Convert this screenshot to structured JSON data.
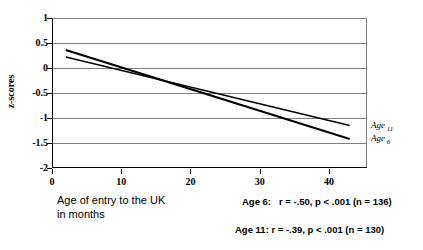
{
  "chart_data": {
    "type": "line",
    "title": "",
    "xlabel": "Age of entry to the UK in months",
    "ylabel": "z-scores",
    "xlim": [
      0,
      45.5
    ],
    "ylim": [
      -2,
      1
    ],
    "grid": true,
    "legend_position": "right-edge-inline",
    "xticks": [
      0,
      10,
      20,
      30,
      40
    ],
    "yticks": [
      1,
      0.5,
      0,
      -0.5,
      -1,
      -1.5,
      -2
    ],
    "series": [
      {
        "name": "Age 6",
        "label": "Age",
        "label_subscript": "6",
        "x": [
          2,
          43
        ],
        "y": [
          0.36,
          -1.42
        ],
        "correlation": "-.50",
        "p_value": "< .001",
        "n": 136,
        "annotation": "Age 6:   r = -.50, p < .001 (n = 136)",
        "color": "#000000",
        "line_width": 2.2
      },
      {
        "name": "Age 11",
        "label": "Age",
        "label_subscript": "11",
        "x": [
          2,
          43
        ],
        "y": [
          0.22,
          -1.15
        ],
        "correlation": "-.39",
        "p_value": "< .001",
        "n": 130,
        "annotation": "Age 11: r = -.39, p < .001 (n = 130)",
        "color": "#000000",
        "line_width": 1.4
      }
    ]
  },
  "axes": {
    "y_title": "z-scores",
    "x_title_line1": "Age of entry to the UK",
    "x_title_line2": "in months",
    "y_tick_labels": [
      "1",
      "0.5",
      "0",
      "-0.5",
      "-1",
      "-1.5",
      "-2"
    ],
    "x_tick_labels": [
      "0",
      "10",
      "20",
      "30",
      "40"
    ]
  },
  "colors": {
    "axis": "#000000",
    "gridline": "#808080",
    "text": "#000000",
    "background": "#ffffff"
  }
}
